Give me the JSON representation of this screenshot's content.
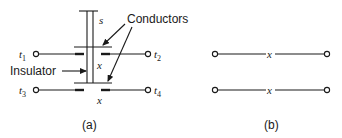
{
  "figure": {
    "panel_a": {
      "caption": "(a)",
      "labels": {
        "spacing": "s",
        "gap_upper": "x",
        "gap_lower": "x",
        "conductors": "Conductors",
        "insulator": "Insulator"
      },
      "terminals": [
        {
          "name": "t",
          "sub": "1",
          "side": "left",
          "row": "upper"
        },
        {
          "name": "t",
          "sub": "2",
          "side": "right",
          "row": "upper"
        },
        {
          "name": "t",
          "sub": "3",
          "side": "left",
          "row": "lower"
        },
        {
          "name": "t",
          "sub": "4",
          "side": "right",
          "row": "lower"
        }
      ]
    },
    "panel_b": {
      "caption": "(b)",
      "lines": [
        {
          "mark": "x",
          "row": "upper"
        },
        {
          "mark": "x",
          "row": "lower"
        }
      ]
    }
  }
}
